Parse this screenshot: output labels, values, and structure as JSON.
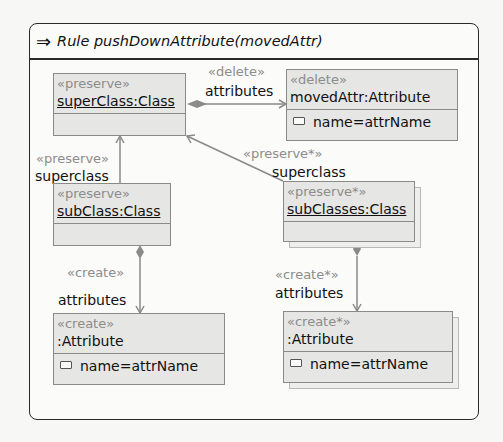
{
  "rule": {
    "icon": "⇒",
    "title": "Rule pushDownAttribute(movedAttr)"
  },
  "nodes": {
    "superClass": {
      "stereotype": "«preserve»",
      "name": "superClass:Class",
      "attributes": []
    },
    "movedAttr": {
      "stereotype": "«delete»",
      "name": "movedAttr:Attribute",
      "attributes": [
        "name=attrName"
      ]
    },
    "subClass": {
      "stereotype": "«preserve»",
      "name": "subClass:Class",
      "attributes": []
    },
    "subClasses": {
      "stereotype": "«preserve*»",
      "name": "subClasses:Class",
      "attributes": [],
      "multi": true
    },
    "createAttr": {
      "stereotype": "«create»",
      "name": ":Attribute",
      "attributes": [
        "name=attrName"
      ]
    },
    "createAttrMulti": {
      "stereotype": "«create*»",
      "name": ":Attribute",
      "attributes": [
        "name=attrName"
      ],
      "multi": true
    }
  },
  "edges": {
    "deleteAttributes": {
      "stereotype": "«delete»",
      "role": "attributes"
    },
    "subSuper": {
      "stereotype": "«preserve»",
      "role": "superclass"
    },
    "subsSuper": {
      "stereotype": "«preserve*»",
      "role": "superclass"
    },
    "createAttributes": {
      "stereotype": "«create»",
      "role": "attributes"
    },
    "createMultiAttributes": {
      "stereotype": "«create*»",
      "role": "attributes"
    }
  },
  "colors": {
    "node_fill": "#e6e6e4",
    "node_border": "#8a8a8a",
    "stereotype_text": "#8c8c8c",
    "edge": "#8a8a8a",
    "frame_border": "#2a2a2a"
  }
}
